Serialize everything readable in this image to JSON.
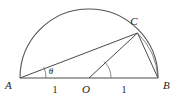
{
  "figure": {
    "type": "geometry-diagram",
    "background_color": "#ffffff",
    "stroke_color": "#4a4a4a",
    "text_color": "#1a1a1a",
    "labels": {
      "point_a": "A",
      "point_b": "B",
      "point_c": "C",
      "point_o": "O",
      "angle_theta": "θ",
      "segment_ao_length": "1",
      "segment_ob_length": "1"
    },
    "points": {
      "A": {
        "x": 20,
        "y": 78
      },
      "B": {
        "x": 158,
        "y": 78
      },
      "O": {
        "x": 89,
        "y": 78
      },
      "C": {
        "x": 137.5,
        "y": 33
      }
    },
    "radius": 69,
    "segments": [
      {
        "name": "diameter-ab",
        "from": "A",
        "to": "B"
      },
      {
        "name": "chord-ac",
        "from": "A",
        "to": "C"
      },
      {
        "name": "radius-oc",
        "from": "O",
        "to": "C"
      },
      {
        "name": "chord-cb",
        "from": "C",
        "to": "B"
      }
    ],
    "arcs": [
      {
        "name": "semicircle-arc",
        "center": "O",
        "radius": 69,
        "from_angle": 180,
        "to_angle": 0
      },
      {
        "name": "arc-cb",
        "description": "small arc of the circle from C to B"
      },
      {
        "name": "angle-arc-a",
        "center": "A",
        "radius": 26
      },
      {
        "name": "angle-arc-o",
        "center": "O",
        "radius": 22
      }
    ]
  }
}
